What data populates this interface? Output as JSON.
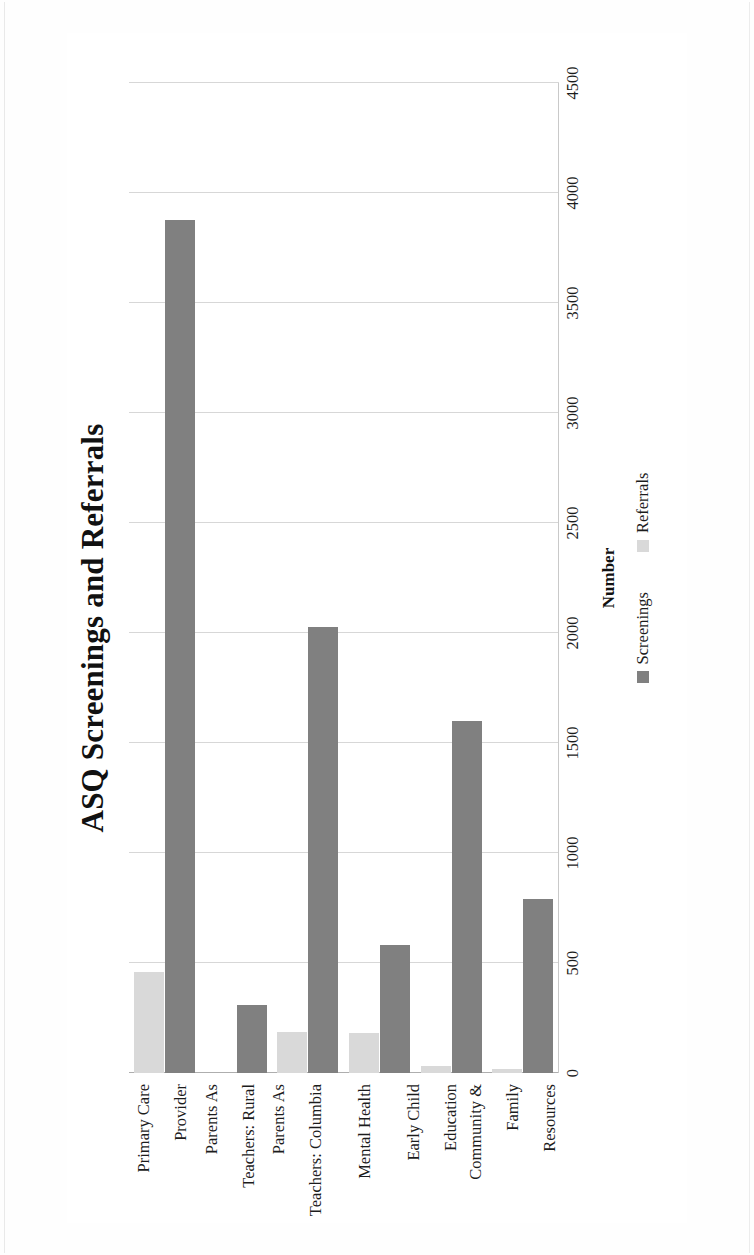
{
  "chart_data": {
    "type": "bar",
    "orientation": "horizontal",
    "title": "ASQ Screenings and Referrals",
    "xlabel": "Number",
    "ylabel": "",
    "xlim": [
      0,
      4500
    ],
    "xticks": [
      "0",
      "500",
      "1000",
      "1500",
      "2000",
      "2500",
      "3000",
      "3500",
      "4000",
      "4500"
    ],
    "xtick_values": [
      0,
      500,
      1000,
      1500,
      2000,
      2500,
      3000,
      3500,
      4000,
      4500
    ],
    "grid": "vertical",
    "legend_position": "bottom",
    "categories": [
      "Community & Family Resources",
      "Early Child Education",
      "Mental Health",
      "Parents As Teachers: Columbia",
      "Parents As Teachers: Rural",
      "Primary Care Provider"
    ],
    "series": [
      {
        "name": "Screenings",
        "color": "#808080",
        "values": [
          790,
          1600,
          580,
          2025,
          310,
          3875
        ]
      },
      {
        "name": "Referrals",
        "color": "#d9d9d9",
        "values": [
          20,
          30,
          180,
          185,
          0,
          460
        ]
      }
    ]
  },
  "page": {
    "rotation_degrees": -90
  }
}
